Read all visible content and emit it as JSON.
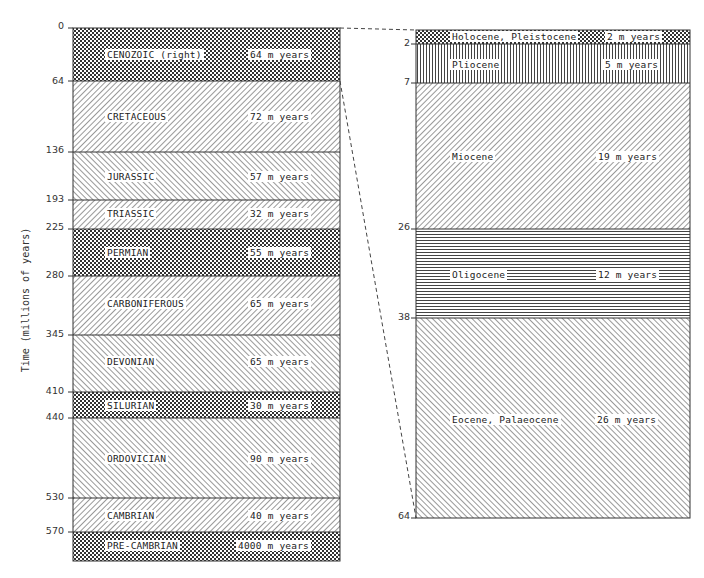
{
  "axis": {
    "ylabel": "Time (millions of years)"
  },
  "left_column": {
    "title": "Geological periods",
    "ticks": [
      "0",
      "64",
      "136",
      "193",
      "225",
      "280",
      "345",
      "410",
      "440",
      "530",
      "570"
    ],
    "periods": [
      {
        "name": "CENOZOIC (right)",
        "duration": "64 m years",
        "start": 0,
        "end": 64,
        "pattern": "crosshatch"
      },
      {
        "name": "CRETACEOUS",
        "duration": "72 m years",
        "start": 64,
        "end": 136,
        "pattern": "diag-right"
      },
      {
        "name": "JURASSIC",
        "duration": "57 m years",
        "start": 136,
        "end": 193,
        "pattern": "diag-left"
      },
      {
        "name": "TRIASSIC",
        "duration": "32 m years",
        "start": 193,
        "end": 225,
        "pattern": "diag-right"
      },
      {
        "name": "PERMIAN",
        "duration": "55 m years",
        "start": 225,
        "end": 280,
        "pattern": "crosshatch"
      },
      {
        "name": "CARBONIFEROUS",
        "duration": "65 m years",
        "start": 280,
        "end": 345,
        "pattern": "diag-right"
      },
      {
        "name": "DEVONIAN",
        "duration": "65 m years",
        "start": 345,
        "end": 410,
        "pattern": "diag-left"
      },
      {
        "name": "SILURIAN",
        "duration": "30 m years",
        "start": 410,
        "end": 440,
        "pattern": "crosshatch"
      },
      {
        "name": "ORDOVICIAN",
        "duration": "90 m years",
        "start": 440,
        "end": 530,
        "pattern": "diag-left"
      },
      {
        "name": "CAMBRIAN",
        "duration": "40 m years",
        "start": 530,
        "end": 570,
        "pattern": "diag-right"
      },
      {
        "name": "PRE-CAMBRIAN",
        "duration": "4000 m years",
        "start": 570,
        "end": null,
        "pattern": "crosshatch"
      }
    ]
  },
  "right_column": {
    "title": "Cenozoic epochs",
    "ticks": [
      "2",
      "7",
      "26",
      "38",
      "64"
    ],
    "epochs": [
      {
        "name": "Holocene, Pleistocene",
        "duration": "2 m years",
        "start": 0,
        "end": 2,
        "pattern": "crosshatch"
      },
      {
        "name": "Pliocene",
        "duration": "5 m years",
        "start": 2,
        "end": 7,
        "pattern": "vertical"
      },
      {
        "name": "Miocene",
        "duration": "19 m years",
        "start": 7,
        "end": 26,
        "pattern": "diag-right"
      },
      {
        "name": "Oligocene",
        "duration": "12 m years",
        "start": 26,
        "end": 38,
        "pattern": "horizontal"
      },
      {
        "name": "Eocene, Palaeocene",
        "duration": "26 m years",
        "start": 38,
        "end": 64,
        "pattern": "diag-left"
      }
    ]
  },
  "colors": {
    "ink": "#222222",
    "background": "#ffffff"
  }
}
